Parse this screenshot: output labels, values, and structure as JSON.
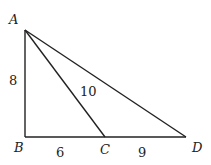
{
  "figure": {
    "points": [
      {
        "name": "A",
        "x": 25,
        "y": 30,
        "label_x": 9,
        "label_y": 24
      },
      {
        "name": "B",
        "x": 25,
        "y": 137,
        "label_x": 14,
        "label_y": 152
      },
      {
        "name": "C",
        "x": 105,
        "y": 137,
        "label_x": 100,
        "label_y": 154
      },
      {
        "name": "D",
        "x": 186,
        "y": 137,
        "label_x": 192,
        "label_y": 152
      }
    ],
    "segments": [
      {
        "from": "A",
        "to": "B",
        "length_label": "8"
      },
      {
        "from": "B",
        "to": "C",
        "length_label": "6"
      },
      {
        "from": "C",
        "to": "D",
        "length_label": "9"
      },
      {
        "from": "A",
        "to": "C",
        "length_label": "10"
      },
      {
        "from": "A",
        "to": "D",
        "length_label": ""
      }
    ],
    "labels": {
      "A": "A",
      "B": "B",
      "C": "C",
      "D": "D",
      "AB": "8",
      "AC": "10",
      "BC": "6",
      "CD": "9"
    },
    "stroke_color": "#222222"
  }
}
